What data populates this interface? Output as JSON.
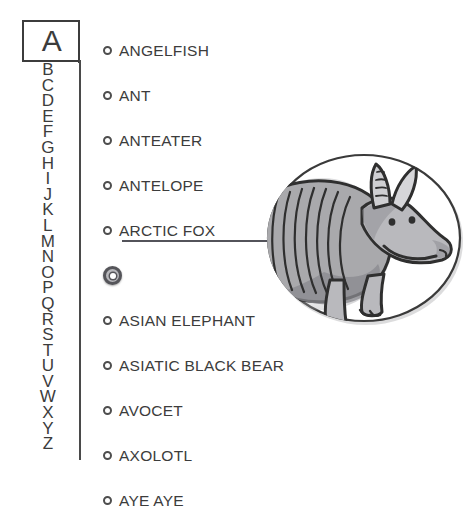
{
  "index": {
    "current_letter": "A",
    "letters": [
      "B",
      "C",
      "D",
      "E",
      "F",
      "G",
      "H",
      "I",
      "J",
      "K",
      "L",
      "M",
      "N",
      "O",
      "P",
      "Q",
      "R",
      "S",
      "T",
      "U",
      "V",
      "W",
      "X",
      "Y",
      "Z"
    ]
  },
  "entries": [
    {
      "label": "ANGELFISH",
      "selected": false
    },
    {
      "label": "ANT",
      "selected": false
    },
    {
      "label": "ANTEATER",
      "selected": false
    },
    {
      "label": "ANTELOPE",
      "selected": false
    },
    {
      "label": "ARCTIC FOX",
      "selected": false
    },
    {
      "label": "",
      "selected": true
    },
    {
      "label": "ASIAN ELEPHANT",
      "selected": false
    },
    {
      "label": "ASIATIC BLACK BEAR",
      "selected": false
    },
    {
      "label": "AVOCET",
      "selected": false
    },
    {
      "label": "AXOLOTL",
      "selected": false
    },
    {
      "label": "AYE AYE",
      "selected": false
    }
  ],
  "illustration": {
    "subject": "armadillo",
    "shell_bands": 7,
    "colors": {
      "outline": "#2f2f2f",
      "shell_fill": "#a9a9ac",
      "body_fill": "#b9b9bd",
      "highlight": "#ffffff",
      "shadow": "#8a8a8f",
      "circle_stroke": "#3a3a3a",
      "background": "#ffffff"
    }
  },
  "theme": {
    "page_background": "#ffffff",
    "ink": "#3c3c3c",
    "marker_ring": "#4e4e4e",
    "selected_marker_fill": "#b8b8bc"
  }
}
